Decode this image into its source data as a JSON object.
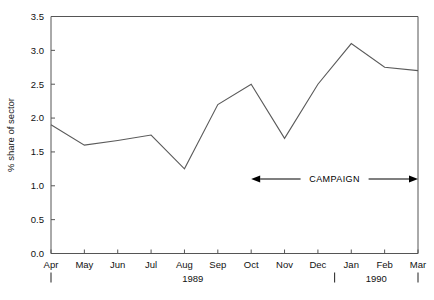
{
  "chart_data": {
    "type": "line",
    "title": "",
    "xlabel": "",
    "ylabel": "% share of sector",
    "ylim": [
      0.0,
      3.5
    ],
    "ytick_labels": [
      "0.0",
      "0.5",
      "1.0",
      "1.5",
      "2.0",
      "2.5",
      "3.0",
      "3.5"
    ],
    "ytick_values": [
      0.0,
      0.5,
      1.0,
      1.5,
      2.0,
      2.5,
      3.0,
      3.5
    ],
    "grid": false,
    "legend": "none",
    "categories": [
      "Apr",
      "May",
      "Jun",
      "Jul",
      "Aug",
      "Sep",
      "Oct",
      "Nov",
      "Dec",
      "Jan",
      "Feb",
      "Mar"
    ],
    "values": [
      1.9,
      1.6,
      1.67,
      1.75,
      1.25,
      2.2,
      2.5,
      1.7,
      2.5,
      3.1,
      2.75,
      2.7
    ],
    "series": [
      {
        "name": "% share of sector",
        "values": [
          1.9,
          1.6,
          1.67,
          1.75,
          1.25,
          2.2,
          2.5,
          1.7,
          2.5,
          3.1,
          2.75,
          2.7
        ]
      }
    ],
    "year_groups": [
      {
        "label": "1989",
        "from": "Apr",
        "to": "Dec"
      },
      {
        "label": "1990",
        "from": "Jan",
        "to": "Mar"
      }
    ],
    "annotations": [
      {
        "name": "campaign",
        "text": "CAMPAIGN",
        "type": "double-arrow",
        "from": "Oct",
        "to": "Mar",
        "y": 1.1
      }
    ],
    "colors": {
      "line": "#5a5a5a",
      "axis": "#555555",
      "text": "#111111",
      "annotation": "#000000",
      "background": "#ffffff"
    }
  }
}
